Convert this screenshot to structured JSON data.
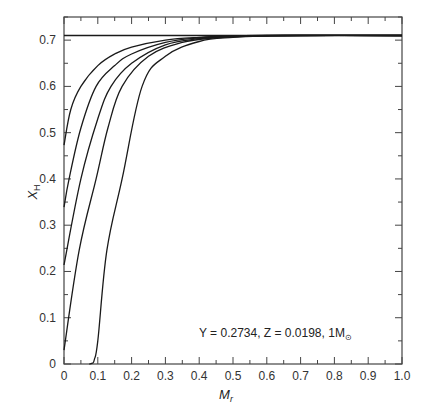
{
  "chart_data": {
    "type": "line",
    "title": "",
    "xlabel": "M_r",
    "ylabel": "X_H",
    "xlim": [
      0,
      1.0
    ],
    "ylim": [
      0,
      0.75
    ],
    "grid": false,
    "legend": null,
    "xticks": [
      "0",
      "0.1",
      "0.2",
      "0.3",
      "0.4",
      "0.5",
      "0.6",
      "0.7",
      "0.8",
      "0.9",
      "1.0"
    ],
    "yticks": [
      "0",
      "0.1",
      "0.2",
      "0.3",
      "0.4",
      "0.5",
      "0.6",
      "0.7"
    ],
    "annotation": "Y = 0.2734, Z = 0.0198, 1M_⊙",
    "series": [
      {
        "name": "initial (ZAMS)",
        "x": [
          0,
          1.0
        ],
        "y": [
          0.71,
          0.71
        ]
      },
      {
        "name": "curve-1",
        "x": [
          0,
          0.02,
          0.05,
          0.1,
          0.15,
          0.2,
          0.3,
          0.4,
          0.5,
          0.6,
          1.0
        ],
        "y": [
          0.473,
          0.55,
          0.6,
          0.645,
          0.67,
          0.685,
          0.7,
          0.706,
          0.709,
          0.71,
          0.71
        ]
      },
      {
        "name": "curve-2",
        "x": [
          0,
          0.015,
          0.05,
          0.095,
          0.15,
          0.2,
          0.3,
          0.4,
          0.5,
          0.6,
          1.0
        ],
        "y": [
          0.339,
          0.4,
          0.51,
          0.6,
          0.645,
          0.67,
          0.695,
          0.705,
          0.709,
          0.71,
          0.71
        ]
      },
      {
        "name": "curve-3",
        "x": [
          0,
          0.05,
          0.1,
          0.139,
          0.2,
          0.3,
          0.4,
          0.5,
          0.65,
          1.0
        ],
        "y": [
          0.214,
          0.4,
          0.53,
          0.6,
          0.65,
          0.69,
          0.703,
          0.708,
          0.71,
          0.71
        ]
      },
      {
        "name": "curve-4",
        "x": [
          0,
          0.045,
          0.095,
          0.13,
          0.172,
          0.25,
          0.35,
          0.45,
          0.55,
          0.65,
          1.0
        ],
        "y": [
          0.03,
          0.246,
          0.4,
          0.51,
          0.6,
          0.665,
          0.695,
          0.705,
          0.709,
          0.71,
          0.71
        ]
      },
      {
        "name": "curve-5",
        "x": [
          0.075,
          0.085,
          0.09,
          0.1,
          0.127,
          0.172,
          0.231,
          0.3,
          0.4,
          0.5,
          0.6,
          0.7,
          1.0
        ],
        "y": [
          0,
          0.002,
          0.01,
          0.05,
          0.246,
          0.4,
          0.6,
          0.665,
          0.697,
          0.706,
          0.709,
          0.71,
          0.71
        ]
      }
    ]
  },
  "labels": {
    "xlabel_main": "M",
    "xlabel_sub": "r",
    "ylabel_main": "X",
    "ylabel_sub": "H",
    "annot_text": "Y = 0.2734, Z = 0.0198, 1M",
    "annot_sub": "⊙"
  }
}
